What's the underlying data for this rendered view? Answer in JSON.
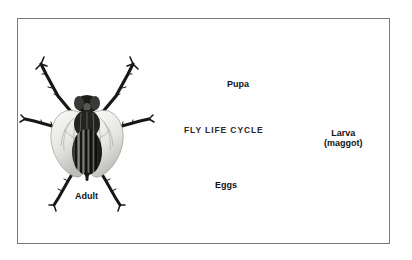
{
  "figure": {
    "title": "FLY LIFE CYCLE",
    "background_color": "#ffffff",
    "frame_color": "#7a7a7a",
    "ink_color": "#121212"
  },
  "stages": {
    "adult": {
      "label": "Adult",
      "icon": "housefly-dorsal-illustration"
    },
    "eggs": {
      "label": "Eggs",
      "icon": "fly-egg-cluster-illustration",
      "count": 4
    },
    "larva": {
      "label_line1": "Larva",
      "label_line2": "(maggot)",
      "icon": "fly-larva-maggot-illustration"
    },
    "pupa": {
      "label": "Pupa",
      "icon": "fly-pupa-puparium-illustration"
    }
  },
  "arrows": [
    {
      "name": "arrow-adult-to-eggs",
      "from": "adult",
      "to": "eggs",
      "direction": "down-right"
    },
    {
      "name": "arrow-eggs-to-larva",
      "from": "eggs",
      "to": "larva",
      "direction": "up-right"
    },
    {
      "name": "arrow-larva-to-pupa",
      "from": "larva",
      "to": "pupa",
      "direction": "left"
    },
    {
      "name": "arrow-pupa-to-adult",
      "from": "pupa",
      "to": "adult",
      "direction": "down-left"
    }
  ]
}
